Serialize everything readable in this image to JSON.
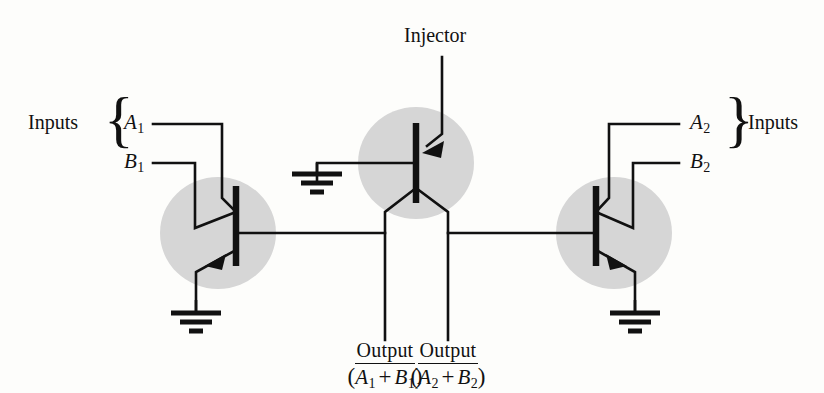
{
  "figure": {
    "ink_color": "#111111",
    "region_fill": "#d6d6d6",
    "background": "#fdfdfb"
  },
  "labels": {
    "inputs_left": "Inputs",
    "inputs_right": "Inputs",
    "injector": "Injector",
    "brace_left": "{",
    "brace_right": "}"
  },
  "signals": {
    "a1": {
      "name": "A",
      "sub": "1"
    },
    "b1": {
      "name": "B",
      "sub": "1"
    },
    "a2": {
      "name": "A",
      "sub": "2"
    },
    "b2": {
      "name": "B",
      "sub": "2"
    }
  },
  "outputs": [
    {
      "word": "Output",
      "open_paren": "(",
      "term1": {
        "name": "A",
        "sub": "1"
      },
      "operator": "+",
      "term2": {
        "name": "B",
        "sub": "1"
      },
      "close_paren": ")",
      "overbar": true
    },
    {
      "word": "Output",
      "open_paren": "(",
      "term1": {
        "name": "A",
        "sub": "2"
      },
      "operator": "+",
      "term2": {
        "name": "B",
        "sub": "2"
      },
      "close_paren": ")",
      "overbar": true
    }
  ],
  "components": {
    "transistor_left": {
      "type": "multi-emitter-npn",
      "emitters": 2
    },
    "transistor_injector": {
      "type": "pnp-injector",
      "collectors": 2
    },
    "transistor_right": {
      "type": "multi-emitter-npn",
      "emitters": 2
    },
    "grounds": 4
  }
}
